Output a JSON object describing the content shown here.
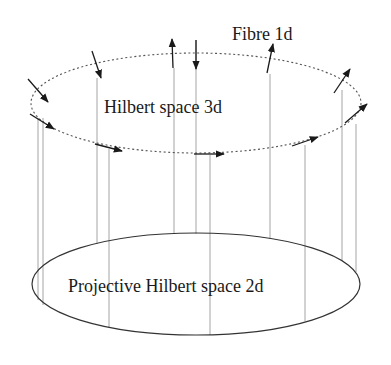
{
  "diagram": {
    "labels": {
      "fibre": "Fibre 1d",
      "hilbert": "Hilbert space 3d",
      "projective": "Projective Hilbert space 2d"
    },
    "colors": {
      "background": "#ffffff",
      "ink": "#1a1a1a",
      "fibre_line": "#9a9a9a",
      "dashed_ellipse": "#555555"
    },
    "top_ellipse": {
      "cx": 196,
      "cy": 103,
      "rx": 165,
      "ry": 50,
      "style": "dotted"
    },
    "bottom_ellipse": {
      "cx": 196,
      "cy": 284,
      "rx": 164,
      "ry": 51,
      "style": "solid"
    },
    "fibres": [
      {
        "x": 38,
        "y1": 118,
        "y2": 300
      },
      {
        "x": 43,
        "y1": 118,
        "y2": 305
      },
      {
        "x": 97,
        "y1": 78,
        "y2": 244
      },
      {
        "x": 109,
        "y1": 149,
        "y2": 327
      },
      {
        "x": 174,
        "y1": 68,
        "y2": 234
      },
      {
        "x": 196,
        "y1": 40,
        "y2": 234
      },
      {
        "x": 210,
        "y1": 155,
        "y2": 335
      },
      {
        "x": 270,
        "y1": 74,
        "y2": 239
      },
      {
        "x": 305,
        "y1": 145,
        "y2": 321
      },
      {
        "x": 342,
        "y1": 90,
        "y2": 260
      },
      {
        "x": 356,
        "y1": 124,
        "y2": 272
      }
    ],
    "arrows": [
      {
        "x1": 28,
        "y1": 79,
        "x2": 48,
        "y2": 102
      },
      {
        "x1": 92,
        "y1": 51,
        "x2": 101,
        "y2": 78
      },
      {
        "x1": 173,
        "y1": 68,
        "x2": 172,
        "y2": 39
      },
      {
        "x1": 196,
        "y1": 40,
        "x2": 196,
        "y2": 69
      },
      {
        "x1": 267,
        "y1": 73,
        "x2": 273,
        "y2": 44
      },
      {
        "x1": 334,
        "y1": 93,
        "x2": 350,
        "y2": 69
      },
      {
        "x1": 30,
        "y1": 114,
        "x2": 54,
        "y2": 129
      },
      {
        "x1": 95,
        "y1": 144,
        "x2": 122,
        "y2": 151
      },
      {
        "x1": 194,
        "y1": 154,
        "x2": 224,
        "y2": 154
      },
      {
        "x1": 292,
        "y1": 146,
        "x2": 318,
        "y2": 137
      },
      {
        "x1": 345,
        "y1": 123,
        "x2": 367,
        "y2": 104
      }
    ]
  }
}
